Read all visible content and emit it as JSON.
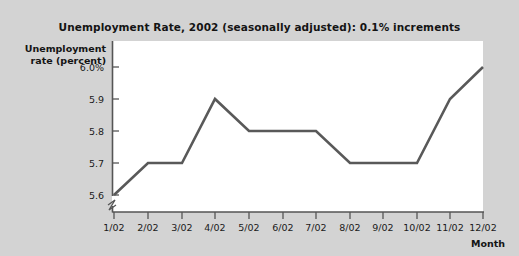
{
  "chart_data": {
    "type": "line",
    "title": "Unemployment Rate, 2002 (seasonally adjusted): 0.1% increments",
    "xlabel": "Month",
    "ylabel": "Unemployment rate (percent)",
    "ylabel_line1": "Unemployment",
    "ylabel_line2": "rate (percent)",
    "categories": [
      "1/02",
      "2/02",
      "3/02",
      "4/02",
      "5/02",
      "6/02",
      "7/02",
      "8/02",
      "9/02",
      "10/02",
      "11/02",
      "12/02"
    ],
    "values": [
      5.6,
      5.7,
      5.7,
      5.9,
      5.8,
      5.8,
      5.8,
      5.7,
      5.7,
      5.7,
      5.9,
      6.0
    ],
    "series": [
      {
        "name": "Unemployment rate",
        "values": [
          5.6,
          5.7,
          5.7,
          5.9,
          5.8,
          5.8,
          5.8,
          5.7,
          5.7,
          5.7,
          5.9,
          6.0
        ]
      }
    ],
    "ylim": [
      5.6,
      6.0
    ],
    "ytick_values": [
      6.0,
      5.9,
      5.8,
      5.7,
      5.6
    ],
    "ytick_labels": [
      "6.0%",
      "5.9",
      "5.8",
      "5.7",
      "5.6"
    ],
    "grid": false,
    "legend": false,
    "axis_break": true,
    "colors": {
      "line": "#595959",
      "plot_background": "#ffffff",
      "figure_background": "#d3d3d3",
      "axis": "#555555",
      "text": "#141414"
    }
  }
}
